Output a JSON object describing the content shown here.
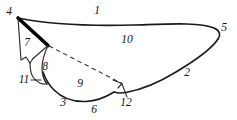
{
  "figure": {
    "background_color": "#ffffff",
    "ink_color": "#1a1a1a",
    "width": 237,
    "height": 120,
    "labels": [
      {
        "id": "1",
        "text": "1",
        "x": 97,
        "y": 11,
        "role": "costal-margin"
      },
      {
        "id": "2",
        "text": "2",
        "x": 187,
        "y": 73,
        "role": "posterior-margin"
      },
      {
        "id": "3",
        "text": "3",
        "x": 63,
        "y": 103,
        "role": "lower-lobe-margin"
      },
      {
        "id": "4",
        "text": "4",
        "x": 9,
        "y": 12,
        "role": "wing-base-apex"
      },
      {
        "id": "5",
        "text": "5",
        "x": 224,
        "y": 28,
        "role": "wing-tip"
      },
      {
        "id": "6",
        "text": "6",
        "x": 94,
        "y": 110,
        "role": "lower-margin"
      },
      {
        "id": "7",
        "text": "7",
        "x": 27,
        "y": 43,
        "role": "basal-cell"
      },
      {
        "id": "8",
        "text": "8",
        "x": 45,
        "y": 67,
        "role": "small-cell"
      },
      {
        "id": "9",
        "text": "9",
        "x": 80,
        "y": 84,
        "role": "anal-lobe"
      },
      {
        "id": "10",
        "text": "10",
        "x": 127,
        "y": 40,
        "role": "main-membrane"
      },
      {
        "id": "11",
        "text": "11",
        "x": 24,
        "y": 80,
        "role": "notch-callout"
      },
      {
        "id": "12",
        "text": "12",
        "x": 126,
        "y": 103,
        "role": "junction-callout"
      }
    ]
  }
}
